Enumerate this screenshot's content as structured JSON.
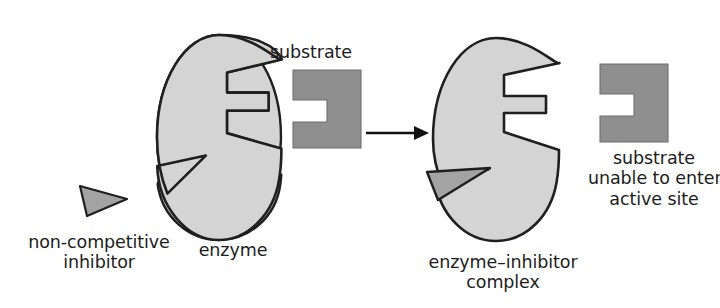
{
  "diagram": {
    "colors": {
      "enzyme_fill": "#d4d4d4",
      "substrate_fill": "#8f8f8f",
      "inhibitor_fill": "#a3a3a3",
      "outline": "#1f1f1f",
      "text": "#1c1c1c",
      "background": "#ffffff"
    },
    "labels": {
      "substrate_left": "substrate",
      "inhibitor": "non-competitive\ninhibitor",
      "enzyme": "enzyme",
      "complex": "enzyme–inhibitor\ncomplex",
      "substrate_right": "substrate\nunable to enter\nactive site"
    },
    "shapes": {
      "enzyme_left": {
        "name": "enzyme",
        "description": "oval enzyme with stepped active site notch on right edge and triangular allosteric site notch on lower left"
      },
      "substrate_left": {
        "name": "substrate",
        "description": "rectangle with stepped notch cut into its left edge, complementary to the active site"
      },
      "inhibitor_left": {
        "name": "non-competitive-inhibitor",
        "description": "free triangle pointing right, approaching the allosteric site"
      },
      "arrow": {
        "name": "reaction-arrow",
        "description": "horizontal arrow pointing right"
      },
      "enzyme_right": {
        "name": "enzyme-inhibitor-complex",
        "description": "oval enzyme with inhibitor bound in allosteric site; active site distorted and narrowed"
      },
      "inhibitor_right": {
        "name": "bound-inhibitor",
        "description": "triangle seated in the allosteric notch of the enzyme"
      },
      "substrate_right": {
        "name": "substrate-excluded",
        "description": "substrate remains separate, cannot enter the distorted active site"
      }
    }
  }
}
